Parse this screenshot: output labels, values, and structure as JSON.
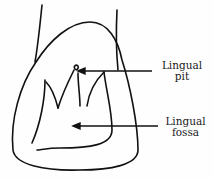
{
  "diagram": {
    "labels": [
      {
        "id": "lingual-pit",
        "line1": "Lingual",
        "line2": "pit"
      },
      {
        "id": "lingual-fossa",
        "line1": "Lingual",
        "line2": "fossa"
      }
    ],
    "stroke_color": "#111111",
    "background": "#fefefe"
  }
}
